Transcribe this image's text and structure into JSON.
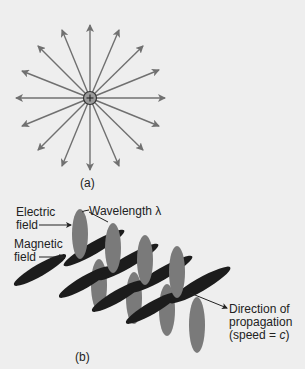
{
  "figure_a": {
    "label": "(a)",
    "charge_symbol": "+",
    "arrow_count": 16
  },
  "figure_b": {
    "label": "(b)",
    "electric_field_line1": "Electric",
    "electric_field_line2": "field",
    "magnetic_field_line1": "Magnetic",
    "magnetic_field_line2": "field",
    "wavelength_label": "Wavelength λ",
    "direction_line1": "Direction of",
    "direction_line2": "propagation",
    "direction_line3_prefix": "(speed = ",
    "direction_line3_var": "c",
    "direction_line3_suffix": ")"
  },
  "colors": {
    "background": "#eeeeee",
    "arrow": "#707070",
    "electric": "#7a7a7a",
    "magnetic": "#1c1c1c",
    "charge_fill": "#9a9a9a"
  }
}
